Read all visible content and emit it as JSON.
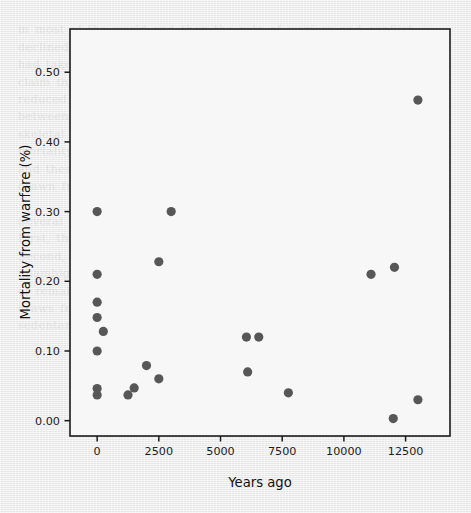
{
  "figure": {
    "background_color": "#ececec",
    "plot_background_color": "#f7f7f7",
    "axis_color": "#1a1a1a",
    "marker_color": "#575757",
    "marker_radius": 4.6,
    "tick_label_color": "#1d1d1d"
  },
  "chart_data": {
    "type": "scatter",
    "title": "",
    "subtitle": "",
    "xlabel": "Years ago",
    "ylabel": "Mortality from warfare (%)",
    "xlim": [
      -1100,
      14300
    ],
    "ylim": [
      -0.022,
      0.562
    ],
    "xticks": [
      0,
      2500,
      5000,
      7500,
      10000,
      12500
    ],
    "xtick_labels": [
      "0",
      "2500",
      "5000",
      "7500",
      "10000",
      "12500"
    ],
    "yticks": [
      0.0,
      0.1,
      0.2,
      0.3,
      0.4,
      0.5
    ],
    "ytick_labels": [
      "0.00",
      "0.10",
      "0.20",
      "0.30",
      "0.40",
      "0.50"
    ],
    "grid": false,
    "legend": null,
    "legend_position": "none",
    "series": [
      {
        "name": "sites",
        "marker": "circle",
        "color": "#575757",
        "points": [
          {
            "x": 0,
            "y": 0.3
          },
          {
            "x": 0,
            "y": 0.21
          },
          {
            "x": 0,
            "y": 0.17
          },
          {
            "x": 0,
            "y": 0.148
          },
          {
            "x": 250,
            "y": 0.128
          },
          {
            "x": 0,
            "y": 0.1
          },
          {
            "x": 0,
            "y": 0.046
          },
          {
            "x": 0,
            "y": 0.037
          },
          {
            "x": 1250,
            "y": 0.037
          },
          {
            "x": 1500,
            "y": 0.047
          },
          {
            "x": 2000,
            "y": 0.079
          },
          {
            "x": 2500,
            "y": 0.06
          },
          {
            "x": 2500,
            "y": 0.228
          },
          {
            "x": 3000,
            "y": 0.3
          },
          {
            "x": 6050,
            "y": 0.12
          },
          {
            "x": 6550,
            "y": 0.12
          },
          {
            "x": 6100,
            "y": 0.07
          },
          {
            "x": 7750,
            "y": 0.04
          },
          {
            "x": 11100,
            "y": 0.21
          },
          {
            "x": 12050,
            "y": 0.22
          },
          {
            "x": 12000,
            "y": 0.003
          },
          {
            "x": 13000,
            "y": 0.03
          },
          {
            "x": 13000,
            "y": 0.46
          }
        ]
      }
    ]
  }
}
